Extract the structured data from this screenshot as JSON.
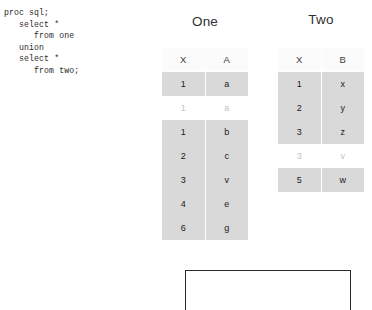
{
  "code": {
    "lines": [
      "proc sql;",
      "   select *",
      "      from one",
      "   union",
      "   select *",
      "      from two;"
    ]
  },
  "tables": [
    {
      "id": "one",
      "title": "One",
      "columns": [
        "X",
        "A"
      ],
      "rows": [
        {
          "cells": [
            "1",
            "a"
          ],
          "faded": false
        },
        {
          "cells": [
            "1",
            "a"
          ],
          "faded": true
        },
        {
          "cells": [
            "1",
            "b"
          ],
          "faded": false
        },
        {
          "cells": [
            "2",
            "c"
          ],
          "faded": false
        },
        {
          "cells": [
            "3",
            "v"
          ],
          "faded": false
        },
        {
          "cells": [
            "4",
            "e"
          ],
          "faded": false
        },
        {
          "cells": [
            "6",
            "g"
          ],
          "faded": false
        }
      ]
    },
    {
      "id": "two",
      "title": "Two",
      "columns": [
        "X",
        "B"
      ],
      "rows": [
        {
          "cells": [
            "1",
            "x"
          ],
          "faded": false
        },
        {
          "cells": [
            "2",
            "y"
          ],
          "faded": false
        },
        {
          "cells": [
            "3",
            "z"
          ],
          "faded": false
        },
        {
          "cells": [
            "3",
            "v"
          ],
          "faded": true
        },
        {
          "cells": [
            "5",
            "w"
          ],
          "faded": false
        }
      ]
    }
  ],
  "result_frame": {
    "label": ""
  },
  "colors": {
    "row_shade": "#d9d9d9",
    "header_shade": "#fbfbfb",
    "faded_text": "#c3c3c3",
    "text": "#1a1a1a",
    "frame_border": "#2a2a2a"
  }
}
